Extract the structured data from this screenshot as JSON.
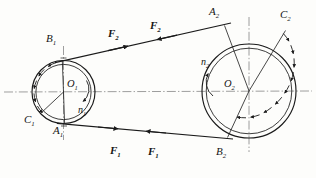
{
  "figure": {
    "type": "belt-drive-diagram",
    "stroke_color": "#1a1a1a",
    "centerline_color": "#5a5a5a",
    "background": "#fdfdfb"
  },
  "pulleys": {
    "small": {
      "center_label": "O",
      "center_sub": "1",
      "speed_label": "n",
      "speed_sub": "1",
      "cx": 63.5,
      "cy": 92,
      "r_outer": 31.5,
      "r_inner": 27.5,
      "rotation": "clockwise"
    },
    "large": {
      "center_label": "O",
      "center_sub": "2",
      "speed_label": "n",
      "speed_sub": "2",
      "cx": 249,
      "cy": 91,
      "r_outer": 47,
      "r_inner": 43,
      "rotation": "clockwise"
    }
  },
  "points": [
    {
      "name": "B",
      "sub": "1",
      "x": 48,
      "y": 37
    },
    {
      "name": "C",
      "sub": "1",
      "x": 26,
      "y": 118
    },
    {
      "name": "A",
      "sub": "1",
      "x": 55,
      "y": 128
    },
    {
      "name": "A",
      "sub": "2",
      "x": 211,
      "y": 10
    },
    {
      "name": "C",
      "sub": "2",
      "x": 281,
      "y": 13
    },
    {
      "name": "B",
      "sub": "2",
      "x": 218,
      "y": 148
    }
  ],
  "forces": [
    {
      "name": "F",
      "sub": "2",
      "x": 110,
      "y": 22,
      "belt": "upper"
    },
    {
      "name": "F",
      "sub": "2",
      "x": 147,
      "y": 17,
      "belt": "upper"
    },
    {
      "name": "F",
      "sub": "1",
      "x": 113,
      "y": 152,
      "belt": "lower"
    },
    {
      "name": "F",
      "sub": "1",
      "x": 151,
      "y": 153,
      "belt": "lower"
    }
  ],
  "speed_markers": [
    {
      "name": "n",
      "sub": "1",
      "x": 79,
      "y": 112,
      "pulley": "small"
    },
    {
      "name": "n",
      "sub": "2",
      "x": 203,
      "y": 62,
      "pulley": "large"
    }
  ],
  "centerlines": {
    "horizontal_y": 92,
    "small_vertical_x": 63.5,
    "large_vertical_x": 249
  },
  "belt": {
    "upper_tangent": {
      "x1": 62,
      "y1": 61,
      "x2": 222,
      "y2": 25
    },
    "lower_tangent": {
      "x1": 64,
      "y1": 124,
      "x2": 226,
      "y2": 138
    }
  }
}
